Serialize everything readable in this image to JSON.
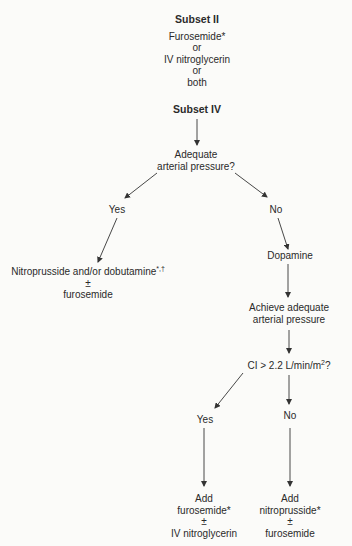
{
  "subset_ii": {
    "title": "Subset II",
    "lines": [
      "Furosemide*",
      "or",
      "IV nitroglycerin",
      "or",
      "both"
    ]
  },
  "subset_iv": {
    "title": "Subset IV"
  },
  "decision_1": {
    "lines": [
      "Adequate",
      "arterial pressure?"
    ]
  },
  "branch_yes_1": {
    "label": "Yes"
  },
  "branch_no_1": {
    "label": "No"
  },
  "yes_1_treatment": {
    "line1": "Nitroprusside and/or dobutamine",
    "line1_marks": "*,†",
    "line2": "±",
    "line3": "furosemide"
  },
  "no_1_step": {
    "label": "Dopamine"
  },
  "achieve": {
    "lines": [
      "Achieve adequate",
      "arterial pressure"
    ]
  },
  "decision_2": {
    "label": "CI > 2.2 L/min/m",
    "sup": "2",
    "suffix": "?"
  },
  "branch_yes_2": {
    "label": "Yes"
  },
  "branch_no_2": {
    "label": "No"
  },
  "yes_2_treatment": {
    "lines": [
      "Add",
      "furosemide*",
      "±",
      "IV nitroglycerin"
    ]
  },
  "no_2_treatment": {
    "lines": [
      "Add",
      "nitroprusside*",
      "±",
      "furosemide"
    ]
  }
}
